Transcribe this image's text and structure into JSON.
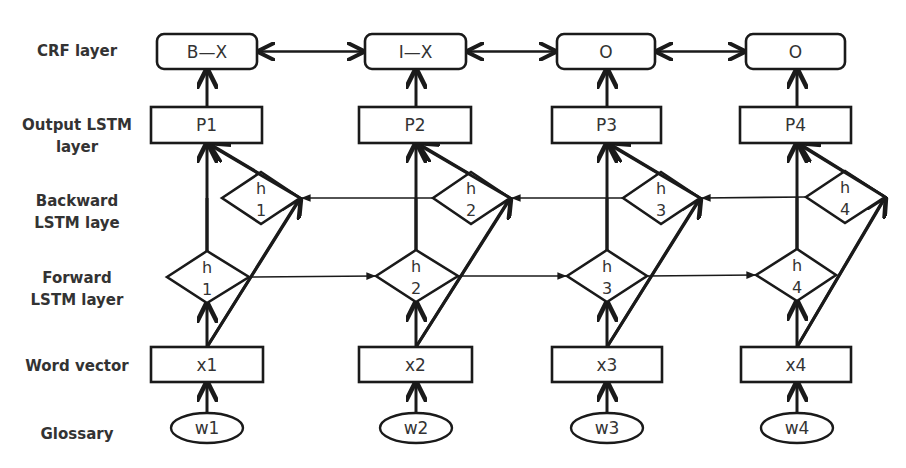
{
  "diagram": {
    "stroke_color": "#1a1a1a",
    "text_color": "#333333",
    "background": "#ffffff"
  },
  "layers": {
    "crf": {
      "line1": "CRF layer"
    },
    "output": {
      "line1": "Output LSTM",
      "line2": "layer"
    },
    "backward": {
      "line1": "Backward",
      "line2": "LSTM laye"
    },
    "forward": {
      "line1": "Forward",
      "line2": "LSTM layer"
    },
    "word_vector": {
      "line1": "Word vector"
    },
    "glossary": {
      "line1": "Glossary"
    }
  },
  "columns": [
    {
      "cx": 207,
      "crf": {
        "label": "B—X",
        "x": 157,
        "w": 100
      },
      "output": {
        "label": "P1",
        "x": 151,
        "w": 111
      },
      "backward": {
        "h": "h",
        "n": "1",
        "l": 222,
        "r": 300,
        "cx": 261,
        "cy": 198
      },
      "forward": {
        "h": "h",
        "n": "1",
        "l": 167,
        "r": 249,
        "cx": 207,
        "cy": 277
      },
      "word": {
        "label": "x1",
        "x": 151,
        "w": 112
      },
      "glossary": {
        "label": "w1"
      }
    },
    {
      "cx": 416,
      "crf": {
        "label": "I—X",
        "x": 365,
        "w": 101
      },
      "output": {
        "label": "P2",
        "x": 359,
        "w": 112
      },
      "backward": {
        "h": "h",
        "n": "2",
        "l": 433,
        "r": 510,
        "cx": 471,
        "cy": 198
      },
      "forward": {
        "h": "h",
        "n": "2",
        "l": 376,
        "r": 458,
        "cx": 416,
        "cy": 276
      },
      "word": {
        "label": "x2",
        "x": 359,
        "w": 113
      },
      "glossary": {
        "label": "w2"
      }
    },
    {
      "cx": 607,
      "crf": {
        "label": "O",
        "x": 557,
        "w": 98
      },
      "output": {
        "label": "P3",
        "x": 552,
        "w": 109
      },
      "backward": {
        "h": "h",
        "n": "3",
        "l": 623,
        "r": 700,
        "cx": 661,
        "cy": 198
      },
      "forward": {
        "h": "h",
        "n": "3",
        "l": 567,
        "r": 647,
        "cx": 607,
        "cy": 276
      },
      "word": {
        "label": "x3",
        "x": 552,
        "w": 110
      },
      "glossary": {
        "label": "w3"
      }
    },
    {
      "cx": 797,
      "crf": {
        "label": "O",
        "x": 746,
        "w": 99
      },
      "output": {
        "label": "P4",
        "x": 740,
        "w": 111
      },
      "backward": {
        "h": "h",
        "n": "4",
        "l": 806,
        "r": 885,
        "cx": 845,
        "cy": 197
      },
      "forward": {
        "h": "h",
        "n": "4",
        "l": 756,
        "r": 836,
        "cx": 797,
        "cy": 275
      },
      "word": {
        "label": "x4",
        "x": 741,
        "w": 110
      },
      "glossary": {
        "label": "w4"
      }
    }
  ],
  "geometry": {
    "crf_y": 34,
    "crf_h": 35,
    "output_y": 107,
    "output_h": 36,
    "diamond_half_h": 26,
    "word_y": 347,
    "word_h": 35,
    "gloss_cy": 428,
    "gloss_rx": 36,
    "gloss_ry": 15
  }
}
